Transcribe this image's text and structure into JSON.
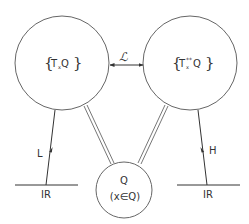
{
  "diagram": {
    "nodes": {
      "left": {
        "label_main": "T",
        "label_sub": "x",
        "label_rest": " Q",
        "brace_open": "{",
        "brace_close": "}"
      },
      "right": {
        "label_main": "T",
        "label_sub": "x",
        "label_sup": "**",
        "label_rest": " Q",
        "brace_open": "{",
        "brace_close": "}"
      },
      "bottom": {
        "line1": "Q",
        "line2": "(x∈Q)"
      }
    },
    "edges": {
      "top_arrow_label": "ℒ",
      "left_arrow_label": "L",
      "right_arrow_label": "H"
    },
    "baselines": {
      "left_label": "IR",
      "right_label": "IR"
    },
    "colors": {
      "stroke": "#555555",
      "double_line": "#777777",
      "text": "#333333"
    }
  }
}
